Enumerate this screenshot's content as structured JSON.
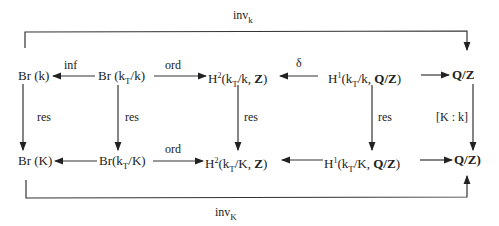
{
  "diagram": {
    "type": "commutative-diagram",
    "top_row": {
      "br_k": {
        "base": "Br",
        "arg": "(k)"
      },
      "br_kT_k": {
        "base": "Br",
        "open": "(k",
        "sub": "T",
        "close": "/k)"
      },
      "h2_kT_k": {
        "base": "H",
        "sup": "2",
        "open": "(k",
        "sub": "T",
        "close": "/k, ",
        "coef": "Z",
        "end": ")"
      },
      "h1_kT_k": {
        "base": "H",
        "sup": "1",
        "open": "(k",
        "sub": "T",
        "close": "/k, ",
        "coef": "Q/Z",
        "end": ")"
      },
      "qz": {
        "text": "Q/Z"
      }
    },
    "bottom_row": {
      "br_K": {
        "base": "Br",
        "arg": "(K)"
      },
      "br_kT_K": {
        "base": "Br",
        "open": "(k",
        "sub": "T",
        "close": "/K)"
      },
      "h2_kT_K": {
        "base": "H",
        "sup": "2",
        "open": "(k",
        "sub": "T",
        "close": "/K, ",
        "coef": "Z",
        "end": ")"
      },
      "h1_kT_K": {
        "base": "H",
        "sup": "1",
        "open": "(k",
        "sub": "T",
        "close": "/K, ",
        "coef": "Q/Z",
        "end": ")"
      },
      "qz": {
        "text": "Q/Z)"
      }
    },
    "arrows": {
      "inf": "inf",
      "ord_top": "ord",
      "delta": "δ",
      "ord_bottom": "ord",
      "res1": "res",
      "res2": "res",
      "res3": "res",
      "res4": "res",
      "index": "[K : k]",
      "inv_k": {
        "base": "inv",
        "sub": "k"
      },
      "inv_K": {
        "base": "inv",
        "sub": "K"
      }
    }
  }
}
